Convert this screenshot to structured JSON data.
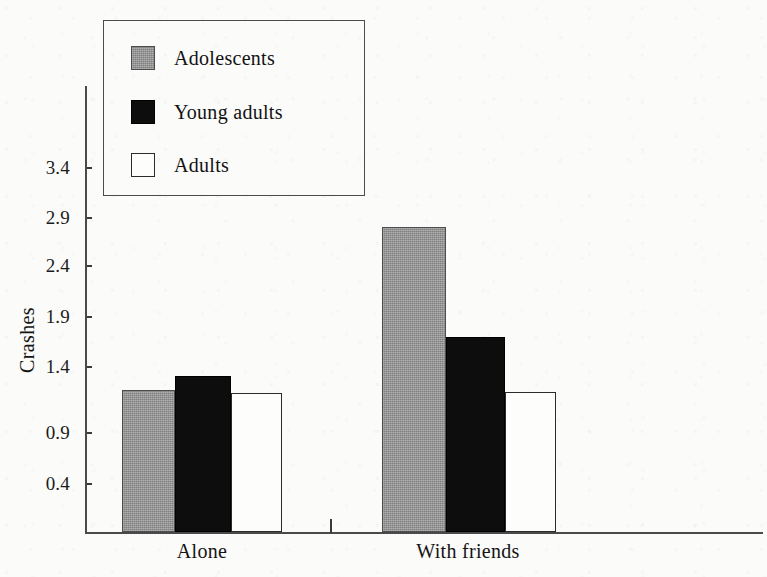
{
  "chart_data": {
    "type": "bar",
    "title": "",
    "subtitle": "",
    "xlabel": "",
    "ylabel": "Crashes",
    "categories": [
      "Alone",
      "With friends"
    ],
    "series": [
      {
        "name": "Adolescents",
        "color": "#9a9a9a",
        "style": "grey-filled",
        "values": [
          1.35,
          2.9
        ]
      },
      {
        "name": "Young adults",
        "color": "#0d0d0d",
        "style": "black-filled",
        "values": [
          1.48,
          1.85
        ]
      },
      {
        "name": "Adults",
        "color": "#ffffff",
        "style": "white-outlined",
        "values": [
          1.32,
          1.33
        ]
      }
    ],
    "yticks": [
      "0.4",
      "0.9",
      "1.4",
      "1.9",
      "2.4",
      "2.9",
      "3.4"
    ],
    "ytick_values": [
      0.4,
      0.9,
      1.4,
      1.9,
      2.4,
      2.9,
      3.4
    ],
    "ylim": [
      0.0,
      3.65
    ],
    "grid": false,
    "legend_position": "upper-left-inside"
  },
  "axis": {
    "y_title": "Crashes",
    "tick_labels": [
      "3.4",
      "2.9",
      "2.4",
      "1.9",
      "1.4",
      "0.9",
      "0.4"
    ]
  },
  "legend": {
    "items": [
      {
        "label": "Adolescents",
        "swatch": "grey-square-swatch"
      },
      {
        "label": "Young adults",
        "swatch": "black-square-swatch"
      },
      {
        "label": "Adults",
        "swatch": "white-square-swatch"
      }
    ]
  },
  "groups": [
    {
      "label": "Alone"
    },
    {
      "label": "With friends"
    }
  ]
}
